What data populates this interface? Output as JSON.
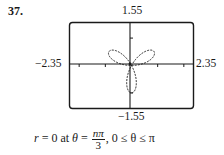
{
  "problem_number": "37.",
  "caption": {
    "lhs": "r",
    "eq1": " = 0 at ",
    "theta": "θ",
    "eq2": " = ",
    "frac_num": "nπ",
    "frac_den": "3",
    "tail": ", 0 ≤ θ ≤ π"
  },
  "chart_data": {
    "type": "line",
    "title": "",
    "equation_shown": "r = 0 at θ = nπ/3, 0 ≤ θ ≤ π",
    "xlim": [
      -2.35,
      2.35
    ],
    "ylim": [
      -1.55,
      1.55
    ],
    "tick_labels": {
      "x_min": "−2.35",
      "x_max": "2.35",
      "y_min": "−1.55",
      "y_max": "1.55"
    },
    "xlabel": "",
    "ylabel": "",
    "grid": false,
    "legend": null,
    "x_ticks": [
      -2,
      -1,
      1,
      2
    ],
    "y_ticks": [
      -1,
      1
    ],
    "series": [
      {
        "name": "rose",
        "parametric": "r = sin(3θ)",
        "petal_directions_deg": [
          30,
          150,
          270
        ],
        "petal_length": 1.0,
        "style": "dashed"
      }
    ]
  },
  "colors": {
    "ink": "#1a1a1a",
    "background": "#ffffff"
  }
}
